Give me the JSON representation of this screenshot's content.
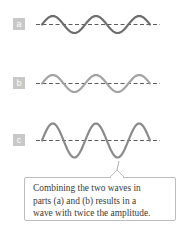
{
  "figure": {
    "panels": [
      {
        "id": "a",
        "label": "a",
        "amplitude": 1,
        "cycles": 3,
        "wave_color": "#6e6e6e"
      },
      {
        "id": "b",
        "label": "b",
        "amplitude": 1,
        "cycles": 3,
        "wave_color": "#a3a3a3"
      },
      {
        "id": "c",
        "label": "c",
        "amplitude": 2,
        "cycles": 3,
        "wave_color": "#8a8a8a"
      }
    ],
    "axis_color": "#4a4a4a",
    "label_box_color": "#c8c8c8",
    "callout": {
      "lines": [
        "Combining the two waves in",
        "parts (a) and (b) results in a",
        "wave with twice the amplitude."
      ],
      "border_color": "#bdbdbd"
    }
  }
}
